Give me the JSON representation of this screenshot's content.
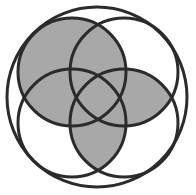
{
  "diagram": {
    "type": "venn-like circle diagram",
    "colors": {
      "background": "#ffffff",
      "stroke": "#2b2b2b",
      "fill_shaded": "#a8a8a8"
    },
    "outer_circle": {
      "cx": 97,
      "cy": 97,
      "r": 90
    },
    "circles": [
      {
        "id": "top-left",
        "cx": 72,
        "cy": 72,
        "r": 54
      },
      {
        "id": "top-right",
        "cx": 124,
        "cy": 72,
        "r": 54
      },
      {
        "id": "bottom-left",
        "cx": 72,
        "cy": 123,
        "r": 54
      },
      {
        "id": "bottom-right",
        "cx": 124,
        "cy": 123,
        "r": 54
      }
    ],
    "shaded_regions": [
      "top-left",
      "top-right ∩ bottom-right",
      "bottom-left ∩ bottom-right"
    ],
    "stroke_width": 3
  }
}
